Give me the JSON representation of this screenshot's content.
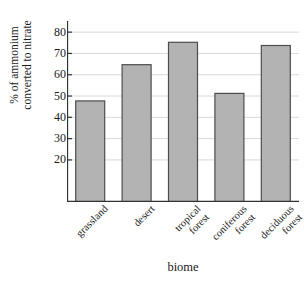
{
  "chart_data": {
    "type": "bar",
    "title": "",
    "xlabel": "biome",
    "ylabel": "% of ammonium\nconverted to nitrate",
    "categories": [
      "grassland",
      "desert",
      "tropical\nforest",
      "coniferous\nforest",
      "deciduous\nforest"
    ],
    "values": [
      47.5,
      64.5,
      75,
      51,
      73.5
    ],
    "ylim": [
      0,
      85
    ],
    "yticks": [
      20,
      30,
      40,
      50,
      60,
      70,
      80
    ],
    "ytick_labels": [
      "20",
      "30",
      "40",
      "50",
      "60",
      "70",
      "80"
    ],
    "grid": true,
    "legend": false,
    "bar_fill": "#b3b3b3",
    "bar_stroke": "#4d4d4d",
    "axis_color": "#333333",
    "grid_color": "#d8d8d8"
  },
  "axis": {
    "y_title_line1": "% of ammonium",
    "y_title_line2": "converted to nitrate",
    "x_title": "biome"
  }
}
